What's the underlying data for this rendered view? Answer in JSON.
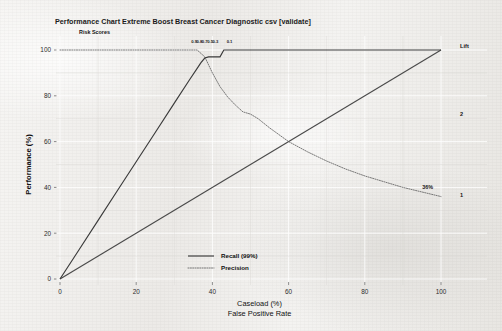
{
  "chart_data": {
    "type": "line",
    "title": "Performance Chart Extreme Boost Breast Cancer Diagnostic csv [validate]",
    "xlabel": "Caseload (%)",
    "xlabel2": "False Positive Rate",
    "ylabel": "Performance (%)",
    "xlim": [
      0,
      100
    ],
    "ylim": [
      0,
      100
    ],
    "xticks": [
      "0",
      "20",
      "40",
      "60",
      "80",
      "100"
    ],
    "xtick_values": [
      0,
      20,
      40,
      60,
      80,
      100
    ],
    "yticks": [
      "0",
      "20",
      "40",
      "60",
      "80",
      "100"
    ],
    "ytick_values": [
      0,
      20,
      40,
      60,
      80,
      100
    ],
    "grid": true,
    "legend_position": "bottom-center",
    "series": [
      {
        "name": "Recall (99%)",
        "style": "solid",
        "x": [
          0,
          5,
          10,
          15,
          20,
          25,
          30,
          34,
          36,
          37,
          38,
          39,
          40,
          41,
          42,
          43,
          44,
          50,
          60,
          70,
          80,
          90,
          100
        ],
        "values": [
          0,
          12.8,
          25.6,
          38.4,
          51.2,
          64,
          76.8,
          87,
          92,
          94.5,
          96.5,
          97,
          97,
          97,
          97,
          100,
          100,
          100,
          100,
          100,
          100,
          100,
          100
        ]
      },
      {
        "name": "Precision",
        "style": "dotted",
        "x": [
          0,
          5,
          10,
          15,
          20,
          25,
          30,
          34,
          36,
          38,
          40,
          42,
          44,
          46,
          48,
          50,
          52,
          55,
          60,
          65,
          70,
          75,
          80,
          85,
          90,
          95,
          100
        ],
        "values": [
          100,
          100,
          100,
          100,
          100,
          100,
          100,
          100,
          100,
          97,
          90,
          84,
          79.5,
          76,
          73,
          72,
          70,
          66,
          60,
          55.5,
          51.5,
          48,
          45,
          42.5,
          40,
          38,
          36
        ]
      },
      {
        "name": "Baseline",
        "style": "solid",
        "x": [
          0,
          100
        ],
        "values": [
          0,
          100
        ]
      }
    ],
    "legend": [
      {
        "label": "Recall (99%)",
        "style": "solid"
      },
      {
        "label": "Precision",
        "style": "dotted"
      }
    ],
    "annotations": [
      {
        "text": "Risk Scores",
        "x": 5,
        "y": 107,
        "kind": "axis-caption"
      },
      {
        "text": "0.9",
        "x": 35.2,
        "y": 103,
        "kind": "threshold-tick"
      },
      {
        "text": "0.8",
        "x": 36.6,
        "y": 103,
        "kind": "threshold-tick"
      },
      {
        "text": "0.7",
        "x": 38.0,
        "y": 103,
        "kind": "threshold-tick"
      },
      {
        "text": "0.5",
        "x": 39.4,
        "y": 103,
        "kind": "threshold-tick"
      },
      {
        "text": "0.3",
        "x": 40.8,
        "y": 103,
        "kind": "threshold-tick"
      },
      {
        "text": "0.1",
        "x": 44.5,
        "y": 103,
        "kind": "threshold-tick"
      },
      {
        "text": "36%",
        "x": 96.5,
        "y": 39.5,
        "kind": "endpoint-value"
      },
      {
        "text": "Lift",
        "x": 105,
        "y": 101,
        "kind": "right-axis-title"
      },
      {
        "text": "2",
        "x": 105,
        "y": 71,
        "kind": "right-axis-tick"
      },
      {
        "text": "1",
        "x": 105,
        "y": 36,
        "kind": "right-axis-tick"
      }
    ],
    "colors": {
      "recall": "#3a3a3a",
      "precision": "#6a6a6a",
      "baseline": "#4a4a4a",
      "background": "#f2f1ef",
      "grid": "#ffffff",
      "text": "#1a1a1a"
    }
  }
}
